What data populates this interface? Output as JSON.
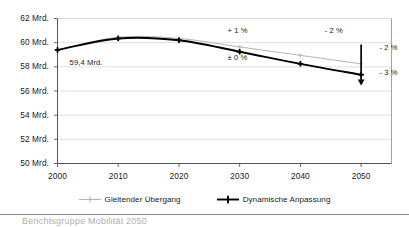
{
  "chart_data": {
    "type": "line",
    "title": "",
    "xlabel": "",
    "ylabel": "",
    "x": [
      2000,
      2010,
      2020,
      2030,
      2040,
      2050
    ],
    "xlim": [
      2000,
      2055
    ],
    "ylim": [
      50,
      62
    ],
    "grid": true,
    "legend_position": "bottom",
    "y_tick_labels": [
      "50 Mrd.",
      "52 Mrd.",
      "54 Mrd.",
      "56 Mrd.",
      "58 Mrd.",
      "60 Mrd.",
      "62 Mrd."
    ],
    "y_tick_values": [
      50,
      52,
      54,
      56,
      58,
      60,
      62
    ],
    "x_tick_labels": [
      "2000",
      "2010",
      "2020",
      "2030",
      "2040",
      "2050"
    ],
    "series": [
      {
        "name": "Gleitender Übergang",
        "color": "#b4b4b4",
        "values": [
          59.4,
          60.45,
          60.35,
          59.65,
          58.95,
          58.25
        ]
      },
      {
        "name": "Dynamische Anpassung",
        "color": "#000000",
        "values": [
          59.4,
          60.35,
          60.2,
          59.25,
          58.25,
          57.35
        ]
      }
    ],
    "annotations": [
      {
        "text": "59,4 Mrd.",
        "x": 2002,
        "y": 58.3
      },
      {
        "text": "+ 1 %",
        "x": 2028,
        "y": 61.0
      },
      {
        "text": "± 0 %",
        "x": 2028,
        "y": 58.7
      },
      {
        "text": "- 2 %",
        "x": 2044,
        "y": 61.0
      },
      {
        "text": "- 2 %",
        "x": 2053,
        "y": 59.6
      },
      {
        "text": "- 3 %",
        "x": 2053,
        "y": 57.5
      }
    ],
    "arrow": {
      "label": "down-arrow-2050",
      "x": 2050,
      "y_start": 59.85,
      "y_end": 56.45,
      "color": "#000000"
    }
  },
  "legend": {
    "items": [
      {
        "label": "Gleitender Übergang",
        "color": "#b4b4b4",
        "marker": "line-plus-marker"
      },
      {
        "label": "Dynamische Anpassung",
        "color": "#000000",
        "marker": "line-plus-marker"
      }
    ]
  },
  "footer": {
    "text": "Berichtsgruppe Mobilität 2050"
  },
  "colors": {
    "axis": "#555555",
    "grid": "#d9d9d9",
    "plot_border": "#8a8a8a",
    "series_gray": "#b4b4b4",
    "series_black": "#000000",
    "text": "#1a1a1a"
  }
}
